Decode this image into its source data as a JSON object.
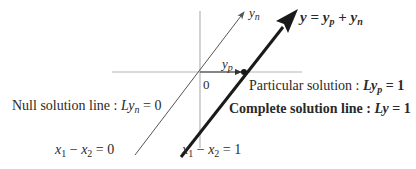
{
  "diagram": {
    "type": "vector-geometry",
    "axes": {
      "origin_label": "0"
    },
    "vectors": {
      "null_vector_label": {
        "base": "y",
        "sub": "n"
      },
      "particular_vector_label": {
        "base": "y",
        "sub": "p"
      },
      "complete_vector_label": {
        "lhs": "y",
        "eq": " = ",
        "t1": "y",
        "t1sub": "p",
        "plus": " + ",
        "t2": "y",
        "t2sub": "n"
      }
    },
    "labels": {
      "particular_prefix": "Particular solution : ",
      "particular_eq_L": "L",
      "particular_eq_y": "y",
      "particular_eq_sub": "p",
      "particular_eq_rhs": " = 1",
      "complete_prefix": "Complete solution line : ",
      "complete_eq_L": "Ly",
      "complete_eq_rhs": " = 1",
      "null_prefix": "Null solution line : ",
      "null_eq_L": "Ly",
      "null_eq_sub": "n",
      "null_eq_rhs": " = 0",
      "null_line_eq": {
        "a": "x",
        "asub": "1",
        "op": " − ",
        "b": "x",
        "bsub": "2",
        "rhs": " = 0"
      },
      "complete_line_eq": {
        "a": "x",
        "asub": "1",
        "op": " − ",
        "b": "x",
        "bsub": "2",
        "rhs": " = 1"
      }
    },
    "colors": {
      "axis": "#b0b0b0",
      "thin_line": "#555555",
      "thick_line": "#1a1a1a",
      "text": "#2a2a2a"
    }
  }
}
